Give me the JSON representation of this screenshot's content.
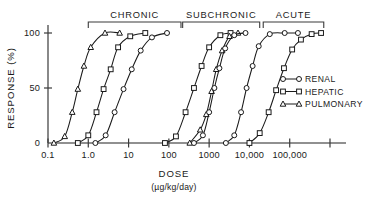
{
  "chart_data": {
    "type": "line",
    "title": "",
    "xlabel": "DOSE",
    "xlabel_units": "(µg/kg/day)",
    "ylabel": "RESPONSE  (%)",
    "xscale": "log",
    "xlim": [
      0.1,
      1000000
    ],
    "ylim": [
      0,
      100
    ],
    "xticks": [
      0.1,
      1,
      10,
      100,
      1000,
      10000,
      100000,
      1000000
    ],
    "xtick_labels": [
      "0.1",
      "1.0",
      "10",
      "100",
      "1000",
      "10,000",
      "100,000",
      ""
    ],
    "yticks": [
      0,
      50,
      100
    ],
    "ytick_labels": [
      "0",
      "50",
      "100"
    ],
    "grid": false,
    "legend_position": "right",
    "legend": [
      {
        "name": "RENAL",
        "marker": "circle"
      },
      {
        "name": "HEPATIC",
        "marker": "square"
      },
      {
        "name": "PULMONARY",
        "marker": "triangle"
      }
    ],
    "exposure_groups": [
      {
        "label": "CHRONIC",
        "x_start": 1.0,
        "x_end": 200
      },
      {
        "label": "SUBCHRONIC",
        "x_start": 220,
        "x_end": 18000
      },
      {
        "label": "ACUTE",
        "x_start": 22000,
        "x_end": 700000
      }
    ],
    "series": [
      {
        "name": "PULMONARY",
        "group": "CHRONIC",
        "marker": "triangle",
        "points": [
          {
            "x": 0.14,
            "y": 0
          },
          {
            "x": 0.26,
            "y": 6
          },
          {
            "x": 0.4,
            "y": 28
          },
          {
            "x": 0.55,
            "y": 49
          },
          {
            "x": 0.78,
            "y": 70
          },
          {
            "x": 1.15,
            "y": 87
          },
          {
            "x": 2.6,
            "y": 100
          },
          {
            "x": 6.0,
            "y": 100
          }
        ]
      },
      {
        "name": "HEPATIC",
        "group": "CHRONIC",
        "marker": "square",
        "points": [
          {
            "x": 0.55,
            "y": 0
          },
          {
            "x": 1.0,
            "y": 7
          },
          {
            "x": 1.6,
            "y": 28
          },
          {
            "x": 2.4,
            "y": 49
          },
          {
            "x": 3.6,
            "y": 67
          },
          {
            "x": 5.5,
            "y": 87
          },
          {
            "x": 11,
            "y": 97
          },
          {
            "x": 26,
            "y": 100
          }
        ]
      },
      {
        "name": "RENAL",
        "group": "CHRONIC",
        "marker": "circle",
        "points": [
          {
            "x": 1.5,
            "y": 0
          },
          {
            "x": 2.7,
            "y": 7
          },
          {
            "x": 4.5,
            "y": 28
          },
          {
            "x": 7.5,
            "y": 49
          },
          {
            "x": 12,
            "y": 67
          },
          {
            "x": 20,
            "y": 84
          },
          {
            "x": 38,
            "y": 96
          },
          {
            "x": 90,
            "y": 100
          }
        ]
      },
      {
        "name": "HEPATIC",
        "group": "SUBCHRONIC",
        "marker": "square",
        "points": [
          {
            "x": 80,
            "y": 0
          },
          {
            "x": 150,
            "y": 6
          },
          {
            "x": 260,
            "y": 28
          },
          {
            "x": 420,
            "y": 50
          },
          {
            "x": 650,
            "y": 70
          },
          {
            "x": 1000,
            "y": 87
          },
          {
            "x": 1900,
            "y": 98
          },
          {
            "x": 3400,
            "y": 100
          }
        ]
      },
      {
        "name": "PULMONARY",
        "group": "SUBCHRONIC",
        "marker": "triangle",
        "points": [
          {
            "x": 330,
            "y": 0
          },
          {
            "x": 600,
            "y": 12
          },
          {
            "x": 850,
            "y": 26
          },
          {
            "x": 1150,
            "y": 47
          },
          {
            "x": 1500,
            "y": 67
          },
          {
            "x": 2100,
            "y": 84
          },
          {
            "x": 3200,
            "y": 97
          },
          {
            "x": 5200,
            "y": 100
          }
        ]
      },
      {
        "name": "RENAL",
        "group": "SUBCHRONIC",
        "marker": "circle",
        "points": [
          {
            "x": 420,
            "y": 0
          },
          {
            "x": 700,
            "y": 7
          },
          {
            "x": 1000,
            "y": 28
          },
          {
            "x": 1350,
            "y": 50
          },
          {
            "x": 1800,
            "y": 68
          },
          {
            "x": 2500,
            "y": 86
          },
          {
            "x": 4200,
            "y": 98
          },
          {
            "x": 8000,
            "y": 100
          }
        ]
      },
      {
        "name": "RENAL",
        "group": "ACUTE",
        "marker": "circle",
        "points": [
          {
            "x": 2600,
            "y": 0
          },
          {
            "x": 4200,
            "y": 7
          },
          {
            "x": 6200,
            "y": 28
          },
          {
            "x": 8500,
            "y": 50
          },
          {
            "x": 12000,
            "y": 70
          },
          {
            "x": 17000,
            "y": 88
          },
          {
            "x": 32000,
            "y": 99
          },
          {
            "x": 75000,
            "y": 100
          },
          {
            "x": 160000,
            "y": 100
          }
        ]
      },
      {
        "name": "HEPATIC",
        "group": "ACUTE",
        "marker": "square",
        "points": [
          {
            "x": 10000,
            "y": 0
          },
          {
            "x": 18000,
            "y": 9
          },
          {
            "x": 30000,
            "y": 28
          },
          {
            "x": 46000,
            "y": 48
          },
          {
            "x": 72000,
            "y": 68
          },
          {
            "x": 115000,
            "y": 85
          },
          {
            "x": 190000,
            "y": 94
          },
          {
            "x": 350000,
            "y": 99
          },
          {
            "x": 600000,
            "y": 100
          }
        ]
      }
    ]
  },
  "colors": {
    "stroke": "#1a1a1a",
    "axis": "#6b6b6b",
    "background": "#ffffff",
    "marker_fill": "#ffffff"
  }
}
